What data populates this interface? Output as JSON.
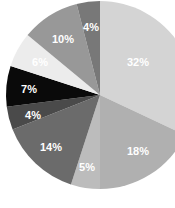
{
  "chart_data": {
    "type": "pie",
    "title": "",
    "subtitle": "",
    "xlabel": "",
    "ylabel": "",
    "grid": false,
    "legend": "none",
    "start_angle_deg": 0,
    "direction": "clockwise",
    "center": {
      "x": 100,
      "y": 95
    },
    "radius": 94,
    "total_percent": 100,
    "categories": [
      "Segment 1",
      "Segment 2",
      "Segment 3",
      "Segment 4",
      "Segment 5",
      "Segment 6",
      "Segment 7",
      "Segment 8",
      "Segment 9"
    ],
    "values": [
      32,
      18,
      5,
      14,
      4,
      7,
      6,
      10,
      4
    ],
    "labels": [
      "32%",
      "18%",
      "5%",
      "14%",
      "4%",
      "7%",
      "6%",
      "10%",
      "4%"
    ],
    "colors": [
      "#d4d4d4",
      "#b0b0b0",
      "#bcbcbc",
      "#6b6b6b",
      "#4a4a4a",
      "#0a0a0a",
      "#ececec",
      "#989898",
      "#787878"
    ],
    "label_color": "#ffffff",
    "background": "#ffffff",
    "slices": [
      {
        "label": "32%",
        "value": 32,
        "color": "#d4d4d4",
        "label_x": 138,
        "label_y": 63
      },
      {
        "label": "18%",
        "value": 18,
        "color": "#b0b0b0",
        "label_x": 138,
        "label_y": 152
      },
      {
        "label": "5%",
        "value": 5,
        "color": "#bcbcbc",
        "label_x": 87,
        "label_y": 168
      },
      {
        "label": "14%",
        "value": 14,
        "color": "#6b6b6b",
        "label_x": 51,
        "label_y": 148
      },
      {
        "label": "4%",
        "value": 4,
        "color": "#4a4a4a",
        "label_x": 33,
        "label_y": 116
      },
      {
        "label": "7%",
        "value": 7,
        "color": "#0a0a0a",
        "label_x": 29,
        "label_y": 90
      },
      {
        "label": "6%",
        "value": 6,
        "color": "#ececec",
        "label_x": 40,
        "label_y": 63
      },
      {
        "label": "10%",
        "value": 10,
        "color": "#989898",
        "label_x": 63,
        "label_y": 40
      },
      {
        "label": "4%",
        "value": 4,
        "color": "#787878",
        "label_x": 91,
        "label_y": 28
      }
    ]
  }
}
